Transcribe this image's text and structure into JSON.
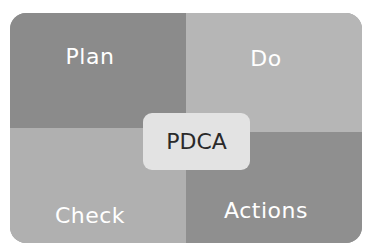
{
  "diagram": {
    "title": "PDCA",
    "center_label": "PDCA",
    "quadrants": [
      {
        "id": "plan",
        "label": "Plan",
        "position": "top-left",
        "color": "#8b8b8b"
      },
      {
        "id": "do",
        "label": "Do",
        "position": "top-right",
        "color": "#b6b6b6"
      },
      {
        "id": "check",
        "label": "Check",
        "position": "bottom-left",
        "color": "#b0b0b0"
      },
      {
        "id": "actions",
        "label": "Actions",
        "position": "bottom-right",
        "color": "#8f8f8f"
      }
    ],
    "center_color": "#e3e3e3"
  }
}
